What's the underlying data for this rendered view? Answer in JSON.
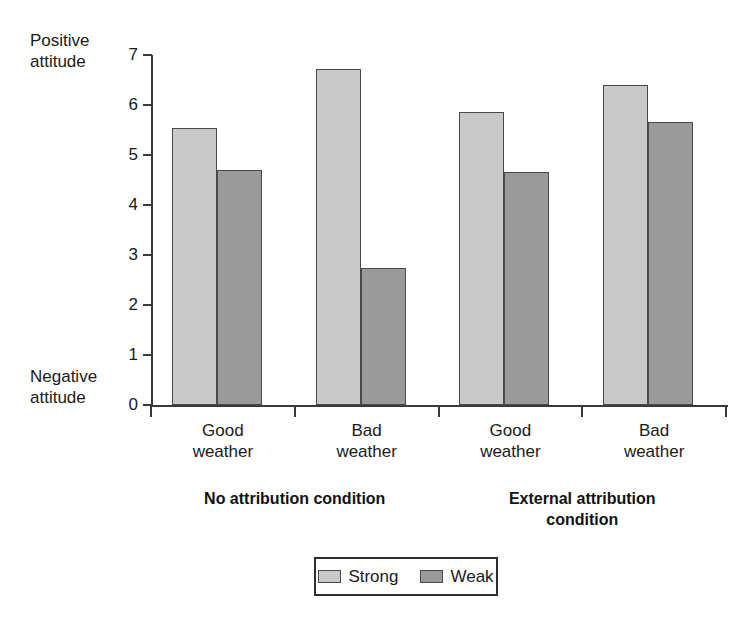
{
  "chart_data": {
    "type": "bar",
    "title": "",
    "subtitle": "",
    "xlabel": "",
    "ylabel": "",
    "categories": [
      "Good\nweather",
      "Bad\nweather",
      "Good\nweather",
      "Bad\nweather"
    ],
    "series": [
      {
        "name": "Strong",
        "values": [
          5.55,
          6.73,
          5.87,
          6.4
        ],
        "color": "#c9c9c9"
      },
      {
        "name": "Weak",
        "values": [
          4.7,
          2.75,
          4.67,
          5.67
        ],
        "color": "#9a9a9a"
      }
    ],
    "ylim": [
      0,
      7
    ],
    "ytick_labels": [
      "7",
      "6",
      "5",
      "4",
      "3",
      "2",
      "1",
      "0"
    ],
    "ytick_values": [
      7,
      6,
      5,
      4,
      3,
      2,
      1,
      0
    ],
    "y_axis_top_caption": "Positive\nattitude",
    "y_axis_bottom_caption": "Negative\nattitude",
    "group_labels": [
      "No attribution condition",
      "External attribution\ncondition"
    ],
    "grid": false,
    "legend_position": "bottom-center",
    "legend_entries": [
      "Strong",
      "Weak"
    ]
  },
  "axis": {
    "top_caption": "Positive\nattitude",
    "bottom_caption": "Negative\nattitude",
    "ticks": [
      {
        "label": "7"
      },
      {
        "label": "6"
      },
      {
        "label": "5"
      },
      {
        "label": "4"
      },
      {
        "label": "3"
      },
      {
        "label": "2"
      },
      {
        "label": "1"
      },
      {
        "label": "0"
      }
    ]
  },
  "categories": [
    {
      "label": "Good\nweather"
    },
    {
      "label": "Bad\nweather"
    },
    {
      "label": "Good\nweather"
    },
    {
      "label": "Bad\nweather"
    }
  ],
  "groups": [
    {
      "label": "No attribution condition"
    },
    {
      "label": "External attribution\ncondition"
    }
  ],
  "legend": {
    "items": [
      {
        "label": "Strong",
        "swatch": "strong"
      },
      {
        "label": "Weak",
        "swatch": "weak"
      }
    ]
  }
}
